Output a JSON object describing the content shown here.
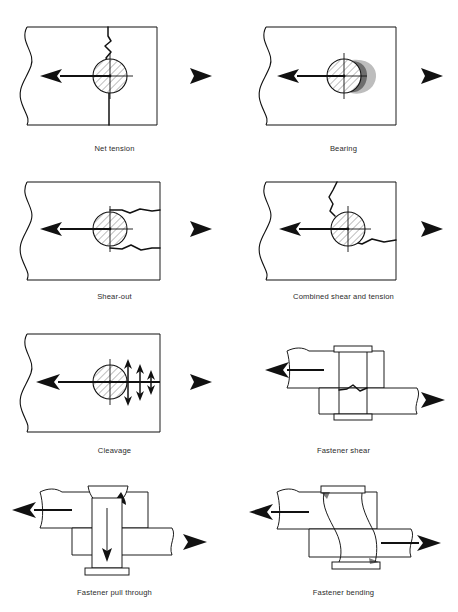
{
  "figure": {
    "background_color": "#ffffff",
    "line_color": "#111111",
    "caption_color": "#2b2b2b",
    "columns": 2,
    "rows": 4
  },
  "panels": [
    {
      "id": "net-tension",
      "caption": "Net tension",
      "row": 1,
      "column": 1,
      "view": "plan",
      "load_arrow_left": "left-pointing-arrow",
      "load_arrow_right": "right-pointing-triangle",
      "features": "vertical jagged crack through hole to top and bottom plate edges"
    },
    {
      "id": "bearing",
      "caption": "Bearing",
      "row": 1,
      "column": 2,
      "view": "plan",
      "load_arrow_left": "left-pointing-arrow",
      "load_arrow_right": "right-pointing-triangle",
      "features": "hole elongated and crushed on right side of fastener"
    },
    {
      "id": "shear-out",
      "caption": "Shear-out",
      "row": 2,
      "column": 1,
      "view": "plan",
      "load_arrow_left": "left-pointing-arrow",
      "load_arrow_right": "right-pointing-triangle",
      "features": "two horizontal tear lines running from hole to right plate edge"
    },
    {
      "id": "combined-shear-and-tension",
      "caption": "Combined shear and tension",
      "row": 2,
      "column": 2,
      "view": "plan",
      "load_arrow_left": "left-pointing-arrow",
      "load_arrow_right": "right-pointing-triangle",
      "features": "crack upward to top edge plus tear sideways to right edge"
    },
    {
      "id": "cleavage",
      "caption": "Cleavage",
      "row": 3,
      "column": 1,
      "view": "plan",
      "load_arrow_left": "left-pointing-arrow",
      "load_arrow_right": "right-pointing-triangle",
      "features": "three double-headed vertical arrows of decreasing size right of hole"
    },
    {
      "id": "fastener-shear",
      "caption": "Fastener shear",
      "row": 3,
      "column": 2,
      "view": "section",
      "load_arrow_left": "left-pointing-arrow",
      "load_arrow_right": "right-pointing-triangle",
      "features": "lap joint with fastener fractured at the faying surface"
    },
    {
      "id": "fastener-pull-through",
      "caption": "Fastener pull through",
      "row": 4,
      "column": 1,
      "view": "section",
      "load_arrow_left": "left-pointing-arrow",
      "load_arrow_right": "right-pointing-triangle",
      "features": "head dished into cup shape, downward arrow through shank"
    },
    {
      "id": "fastener-bending",
      "caption": "Fastener bending",
      "row": 4,
      "column": 2,
      "view": "section",
      "load_arrow_left": "left-pointing-arrow",
      "load_arrow_right": "right-pointing-arrow",
      "features": "fastener shank deformed into an S-curve between plates"
    }
  ]
}
